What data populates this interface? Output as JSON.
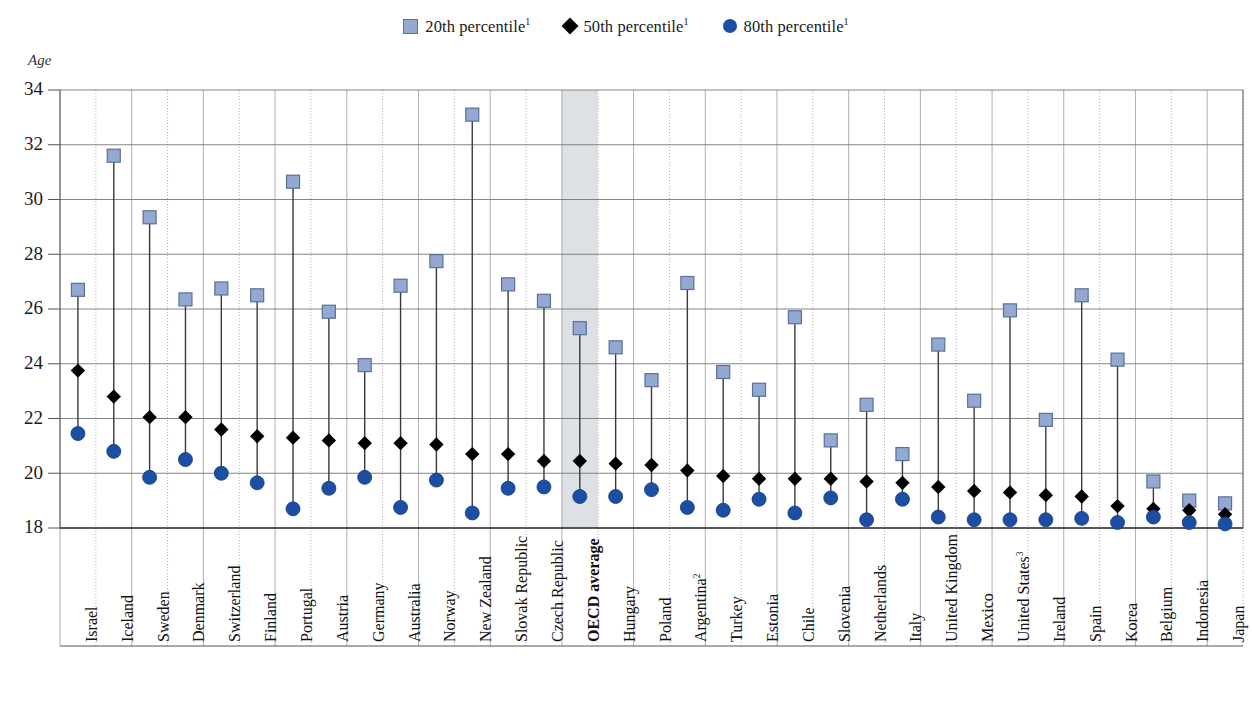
{
  "chart_data": {
    "type": "scatter",
    "title": "",
    "subtitle": "",
    "xlabel": "",
    "ylabel": "Age",
    "ylim": [
      18,
      34
    ],
    "yticks": [
      18,
      20,
      22,
      24,
      26,
      28,
      30,
      32,
      34
    ],
    "grid": true,
    "legend_position": "top-center",
    "highlight_category": "OECD average",
    "colors": {
      "p20": "#93a9d2",
      "p20_edge": "#5a6f99",
      "p50": "#000000",
      "p80": "#1c4ea3",
      "connector": "#3a3a3a",
      "grid": "#777777",
      "highlight_band": "#dde1e6"
    },
    "legend": [
      {
        "label": "20th percentile",
        "note": "1",
        "marker": "square",
        "color": "#93a9d2"
      },
      {
        "label": "50th percentile",
        "note": "1",
        "marker": "diamond",
        "color": "#000000"
      },
      {
        "label": "80th percentile",
        "note": "1",
        "marker": "circle",
        "color": "#1c4ea3"
      }
    ],
    "categories": [
      "Israel",
      "Iceland",
      "Sweden",
      "Denmark",
      "Switzerland",
      "Finland",
      "Portugal",
      "Austria",
      "Germany",
      "Australia",
      "Norway",
      "New Zealand",
      "Slovak Republic",
      "Czech Republic",
      "OECD average",
      "Hungary",
      "Poland",
      "Argentina",
      "Turkey",
      "Estonia",
      "Chile",
      "Slovenia",
      "Netherlands",
      "Italy",
      "United Kingdom",
      "Mexico",
      "United States",
      "Ireland",
      "Spain",
      "Korea",
      "Belgium",
      "Indonesia",
      "Japan"
    ],
    "category_notes": {
      "Argentina": "2",
      "United States": "3"
    },
    "series": [
      {
        "name": "20th percentile",
        "marker": "square",
        "values": [
          26.7,
          31.6,
          29.35,
          26.35,
          26.75,
          26.5,
          30.65,
          25.9,
          23.95,
          26.85,
          27.75,
          33.1,
          26.9,
          26.3,
          25.3,
          24.6,
          23.4,
          26.95,
          23.7,
          23.05,
          25.7,
          21.2,
          22.5,
          20.7,
          24.7,
          22.65,
          25.95,
          21.95,
          26.5,
          24.15,
          19.7,
          19.0,
          18.9
        ]
      },
      {
        "name": "50th percentile",
        "marker": "diamond",
        "values": [
          23.75,
          22.8,
          22.05,
          22.05,
          21.6,
          21.35,
          21.3,
          21.2,
          21.1,
          21.1,
          21.05,
          20.7,
          20.7,
          20.45,
          20.45,
          20.35,
          20.3,
          20.1,
          19.9,
          19.8,
          19.8,
          19.8,
          19.7,
          19.65,
          19.5,
          19.35,
          19.3,
          19.2,
          19.15,
          18.8,
          18.7,
          18.65,
          18.5
        ]
      },
      {
        "name": "80th percentile",
        "marker": "circle",
        "values": [
          21.45,
          20.8,
          19.85,
          20.5,
          20.0,
          19.65,
          18.7,
          19.45,
          19.85,
          18.75,
          19.75,
          18.55,
          19.45,
          19.5,
          19.15,
          19.15,
          19.4,
          18.75,
          18.65,
          19.05,
          18.55,
          19.1,
          18.3,
          19.05,
          18.4,
          18.3,
          18.3,
          18.3,
          18.35,
          18.2,
          18.4,
          18.2,
          18.15
        ]
      }
    ]
  }
}
